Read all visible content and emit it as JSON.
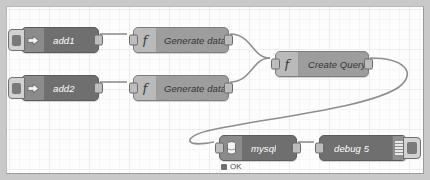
{
  "app": {
    "name": "node-red-flow-editor",
    "canvas_background": "#fdfdfd",
    "grid_color": "#ededed",
    "wire_color": "#8e8e8e",
    "node_dark_color": "#6f6f6f",
    "node_mid_color": "#9d9d9d",
    "status_ok_color": "#6f6f6f"
  },
  "nodes": [
    {
      "id": "add1",
      "label": "add1",
      "type": "inject",
      "icon": "arrow-right-icon",
      "style": "dark",
      "has_inject_button": true,
      "inputs": 0,
      "outputs": 1
    },
    {
      "id": "add2",
      "label": "add2",
      "type": "inject",
      "icon": "arrow-right-icon",
      "style": "dark",
      "has_inject_button": true,
      "inputs": 0,
      "outputs": 1
    },
    {
      "id": "gen1",
      "label": "Generate data1",
      "type": "function",
      "icon": "function-icon",
      "style": "mid",
      "inputs": 1,
      "outputs": 1
    },
    {
      "id": "gen2",
      "label": "Generate data2",
      "type": "function",
      "icon": "function-icon",
      "style": "mid",
      "inputs": 1,
      "outputs": 1
    },
    {
      "id": "query",
      "label": "Create Query",
      "type": "function",
      "icon": "function-icon",
      "style": "mid",
      "inputs": 1,
      "outputs": 1
    },
    {
      "id": "mysql",
      "label": "mysql",
      "type": "database",
      "icon": "database-icon",
      "style": "dark",
      "inputs": 1,
      "outputs": 1,
      "status": {
        "text": "OK",
        "state": "ok"
      }
    },
    {
      "id": "debug",
      "label": "debug 5",
      "type": "debug",
      "icon": "debug-stripes-icon",
      "style": "dark",
      "inputs": 1,
      "outputs": 0,
      "has_toggle_button": true
    }
  ],
  "links": [
    {
      "from": "add1",
      "to": "gen1"
    },
    {
      "from": "add2",
      "to": "gen2"
    },
    {
      "from": "gen1",
      "to": "query"
    },
    {
      "from": "gen2",
      "to": "query"
    },
    {
      "from": "query",
      "to": "mysql"
    },
    {
      "from": "mysql",
      "to": "debug"
    }
  ]
}
